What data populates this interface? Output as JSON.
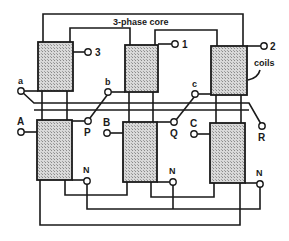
{
  "diagram": {
    "title": "3-phase core",
    "callout": "coils",
    "primary_terminals": [
      "3",
      "1",
      "2"
    ],
    "secondary_top_terminals": [
      "a",
      "b",
      "c"
    ],
    "input_terminals": [
      "A",
      "B",
      "C"
    ],
    "output_terminals": [
      "P",
      "Q",
      "R"
    ],
    "neutral_terminals": [
      "N",
      "N",
      "N"
    ],
    "colors": {
      "line": "#1a1a1a",
      "coil_fill": "#c8c8c8",
      "background": "#ffffff"
    }
  }
}
